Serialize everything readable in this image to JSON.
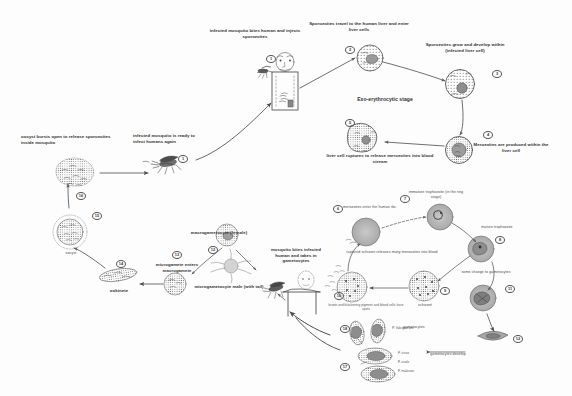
{
  "diagram": {
    "stage_labels": {
      "exo_erythrocytic": "Exo-erythrocytic stage"
    },
    "steps": [
      {
        "id": "s1",
        "num": "1",
        "text": "infected mosquito bites human and injects sporozoites"
      },
      {
        "id": "s2",
        "num": "2",
        "text": "Sporozoites travel to the human liver and enter liver cells"
      },
      {
        "id": "s3",
        "num": "3",
        "text": "Sporozoites grow and develop within (infected liver cell)"
      },
      {
        "id": "s4",
        "num": "4",
        "text": "Merozoites are produced within the liver cell"
      },
      {
        "id": "s5",
        "num": "5",
        "text": "liver cell ruptures to release merozoites into blood stream"
      },
      {
        "id": "s6",
        "num": "6",
        "text": "merozoites enter the human rbc"
      },
      {
        "id": "s7",
        "num": "7",
        "text": "immature trophozoite (in the ring stage)"
      },
      {
        "id": "s8",
        "num": "8",
        "text": "mature trophozoite"
      },
      {
        "id": "s9",
        "num": "9",
        "text": "schizont"
      },
      {
        "id": "s10",
        "num": "10",
        "text": "ruptured schizont releases many merozoites into blood"
      },
      {
        "id": "s10b",
        "num": "10",
        "text": "brown and blackening pigment and blood cells have spots"
      },
      {
        "id": "s11",
        "num": "11",
        "text": "some change to gametocytes"
      },
      {
        "id": "s12",
        "num": "12",
        "text": "gametocytes develop"
      },
      {
        "id": "s13",
        "num": "13",
        "text": "microgamete enters macrogamete"
      },
      {
        "id": "s14",
        "num": "14",
        "text": "ookinete"
      },
      {
        "id": "s15",
        "num": "15",
        "text": "oocyst"
      },
      {
        "id": "s16",
        "num": "16",
        "text": "oocyst bursts open to release sporozoites inside mosquito"
      },
      {
        "id": "s17",
        "num": "17",
        "text": "P. vivax P. ovale P. malariae"
      },
      {
        "id": "s18",
        "num": "18",
        "text": "P. falciparum"
      }
    ],
    "labels": {
      "infected_mosquito_bites": "infected mosquito bites human and injects sporozoites",
      "sporozoites_travel": "Sporozoites travel to the human liver and enter liver cells",
      "sporozoites_grow": "Sporozoites grow and develop within (infected liver cell)",
      "exo_erythrocytic_stage": "Exo-erythrocytic stage",
      "merozoites_produced": "Merozoites are produced within the liver cell",
      "liver_cell_ruptures": "liver cell ruptures to release merozoites into blood stream",
      "mosquito_ready": "infected mosquito is ready to infect humans again",
      "oocyst_bursts": "oocyst bursts open to release sporozoites inside mosquito",
      "oocyst": "oocyst",
      "ookinete": "ookinete",
      "microgamete_enters": "microgamete enters macrogamete",
      "macrogametocyte": "macrogametocyte (female)",
      "microgametocyte": "microgametocyte male (with tail)",
      "mosquito_bites_infected": "mosquito bites infected human and takes in gametocytes",
      "merozoites_enter_rbc": "merozoites enter the human rbc",
      "immature_trophozoite": "immature trophozoite (in the ring stage)",
      "mature_trophozoite": "mature trophozoite",
      "ruptured_schizont": "ruptured schizont releases many merozoites into blood",
      "brown_pigment": "brown and blackening pigment and blood cells have spots",
      "schizont": "schizont",
      "some_change": "some change to gametocytes",
      "gametocytes_develop": "gametocytes develop",
      "gametocytes": "gametocytes",
      "p_falciparum": "P. falciparum",
      "p_vivax": "P. vivax",
      "p_ovale": "P. ovale",
      "p_malariae": "P. malariae"
    },
    "numbers": {
      "n1": "1",
      "n1b": "1",
      "n2": "2",
      "n3": "3",
      "n4": "4",
      "n5": "5",
      "n6": "6",
      "n7": "7",
      "n8": "8",
      "n9": "9",
      "n10": "10",
      "n11": "11",
      "n12": "12",
      "n12b": "12",
      "n13": "13",
      "n14": "14",
      "n15": "15",
      "n16": "16",
      "n17": "17",
      "n18": "18"
    },
    "colors": {
      "ink": "#3a3a3a",
      "cell_fill": "#b5b5b5",
      "cell_stroke": "#555555",
      "paper": "#fdfdfd"
    }
  }
}
